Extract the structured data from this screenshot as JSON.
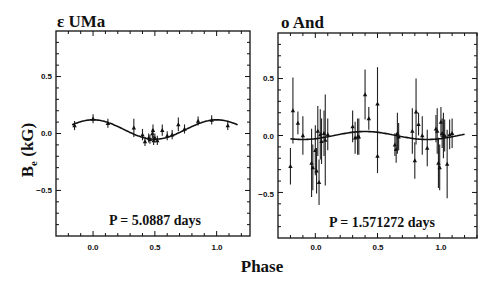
{
  "figure": {
    "ylabel_main": "B",
    "ylabel_sub": "e",
    "ylabel_unit": " (kG)",
    "xlabel": "Phase"
  },
  "panels": [
    {
      "title": "ε UMa",
      "period_label": "P = 5.0887 days",
      "xticks": [
        "0.0",
        "0.5",
        "1.0"
      ],
      "yticks": [
        "0.5",
        "0.0",
        "−0.5"
      ]
    },
    {
      "title": "o And",
      "period_label": "P = 1.571272 days",
      "xticks": [
        "0.0",
        "0.5",
        "1.0"
      ],
      "yticks": [
        "0.5",
        "0.0",
        "−0.5"
      ]
    }
  ],
  "chart_data": [
    {
      "type": "scatter",
      "title": "ε UMa",
      "annotation": "P = 5.0887 days",
      "xlabel": "Phase",
      "ylabel": "B_e (kG)",
      "xlim": [
        -0.3,
        1.27
      ],
      "ylim": [
        -0.9,
        0.9
      ],
      "xticks": [
        0.0,
        0.5,
        1.0
      ],
      "yticks": [
        -0.5,
        0.0,
        0.5
      ],
      "grid": false,
      "series": [
        {
          "name": "observations",
          "x": [
            -0.15,
            0.0,
            0.12,
            0.33,
            0.4,
            0.42,
            0.45,
            0.46,
            0.48,
            0.485,
            0.49,
            0.5,
            0.52,
            0.56,
            0.6,
            0.64,
            0.69,
            0.74,
            0.85,
            0.96,
            1.09
          ],
          "y": [
            0.07,
            0.13,
            0.09,
            0.05,
            -0.01,
            -0.07,
            -0.04,
            -0.05,
            0.0,
            0.03,
            -0.06,
            -0.04,
            -0.06,
            0.03,
            -0.02,
            -0.01,
            0.08,
            0.04,
            0.11,
            0.12,
            0.07
          ],
          "yerr": [
            0.04,
            0.04,
            0.04,
            0.08,
            0.05,
            0.04,
            0.04,
            0.04,
            0.04,
            0.05,
            0.04,
            0.04,
            0.04,
            0.05,
            0.04,
            0.04,
            0.06,
            0.04,
            0.04,
            0.04,
            0.04
          ]
        },
        {
          "name": "sine fit",
          "mean": 0.035,
          "amplitude": 0.085,
          "phase_of_max": 0.0,
          "x_range": [
            -0.17,
            1.17
          ]
        }
      ]
    },
    {
      "type": "scatter",
      "title": "o And",
      "annotation": "P = 1.571272 days",
      "xlabel": "Phase",
      "ylabel": "B_e (kG)",
      "xlim": [
        -0.3,
        1.3
      ],
      "ylim": [
        -0.9,
        0.9
      ],
      "xticks": [
        0.0,
        0.5,
        1.0
      ],
      "yticks": [
        -0.5,
        0.0,
        0.5
      ],
      "grid": false,
      "series": [
        {
          "name": "observations",
          "x": [
            -0.2,
            -0.18,
            -0.14,
            -0.1,
            -0.03,
            -0.02,
            0.0,
            0.01,
            0.02,
            0.03,
            0.04,
            0.05,
            0.07,
            0.08,
            0.1,
            0.3,
            0.32,
            0.34,
            0.35,
            0.4,
            0.43,
            0.5,
            0.5,
            0.64,
            0.65,
            0.66,
            0.67,
            0.78,
            0.8,
            0.81,
            0.83,
            0.86,
            0.9,
            0.97,
            0.98,
            0.99,
            1.0,
            1.01,
            1.02,
            1.03,
            1.04,
            1.06,
            1.08,
            1.1
          ],
          "y": [
            -0.27,
            0.22,
            0.11,
            0.0,
            -0.24,
            -0.28,
            -0.13,
            -0.31,
            0.04,
            -0.41,
            0.01,
            -0.05,
            0.02,
            -0.04,
            0.01,
            0.08,
            -0.02,
            -0.01,
            -0.01,
            0.36,
            0.15,
            0.28,
            -0.18,
            -0.08,
            -0.12,
            0.02,
            -0.01,
            0.04,
            -0.22,
            0.21,
            0.1,
            0.0,
            -0.11,
            0.06,
            0.04,
            -0.24,
            -0.28,
            0.12,
            0.02,
            0.0,
            0.0,
            -0.25,
            0.01,
            0.02
          ],
          "yerr": [
            0.16,
            0.29,
            0.1,
            0.17,
            0.3,
            0.2,
            0.22,
            0.2,
            0.22,
            0.2,
            0.22,
            0.2,
            0.2,
            0.4,
            0.14,
            0.14,
            0.14,
            0.16,
            0.16,
            0.22,
            0.1,
            0.32,
            0.15,
            0.1,
            0.12,
            0.18,
            0.12,
            0.2,
            0.16,
            0.29,
            0.1,
            0.17,
            0.16,
            0.12,
            0.2,
            0.22,
            0.2,
            0.13,
            0.13,
            0.2,
            0.14,
            0.3,
            0.13,
            0.13
          ]
        },
        {
          "name": "sine fit",
          "mean": 0.0,
          "amplitude": 0.035,
          "phase_of_max": 0.4,
          "x_range": [
            -0.2,
            1.2
          ]
        }
      ]
    }
  ]
}
